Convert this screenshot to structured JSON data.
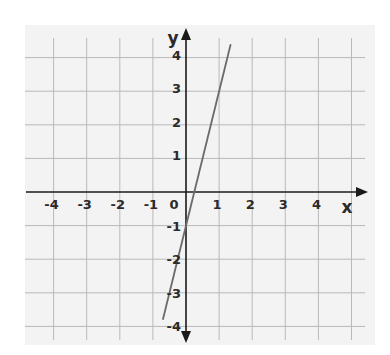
{
  "chart_data": {
    "type": "line",
    "title": "",
    "xlabel": "x",
    "ylabel": "y",
    "xlim": [
      -4.8,
      5.4
    ],
    "ylim": [
      -4.5,
      4.6
    ],
    "grid": true,
    "x_ticks": [
      -4,
      -3,
      -2,
      -1,
      0,
      1,
      2,
      3,
      4
    ],
    "y_ticks": [
      -4,
      -3,
      -2,
      -1,
      1,
      2,
      3,
      4
    ],
    "x_tick_labels": [
      "-4",
      "-3",
      "-2",
      "-1",
      "0",
      "1",
      "2",
      "3",
      "4"
    ],
    "y_tick_labels": [
      "-4",
      "-3",
      "-2",
      "-1",
      "1",
      "2",
      "3",
      "4"
    ],
    "series": [
      {
        "name": "y = 4x - 1",
        "equation": "y = 4x - 1",
        "slope": 4,
        "intercept": -1,
        "x": [
          -0.7,
          1.35
        ],
        "y": [
          -3.8,
          4.4
        ],
        "color": "#6a6a6a"
      }
    ],
    "colors": {
      "background": "#f3f3f3",
      "grid": "#b9b9b9",
      "axis": "#1a1a1a"
    }
  }
}
